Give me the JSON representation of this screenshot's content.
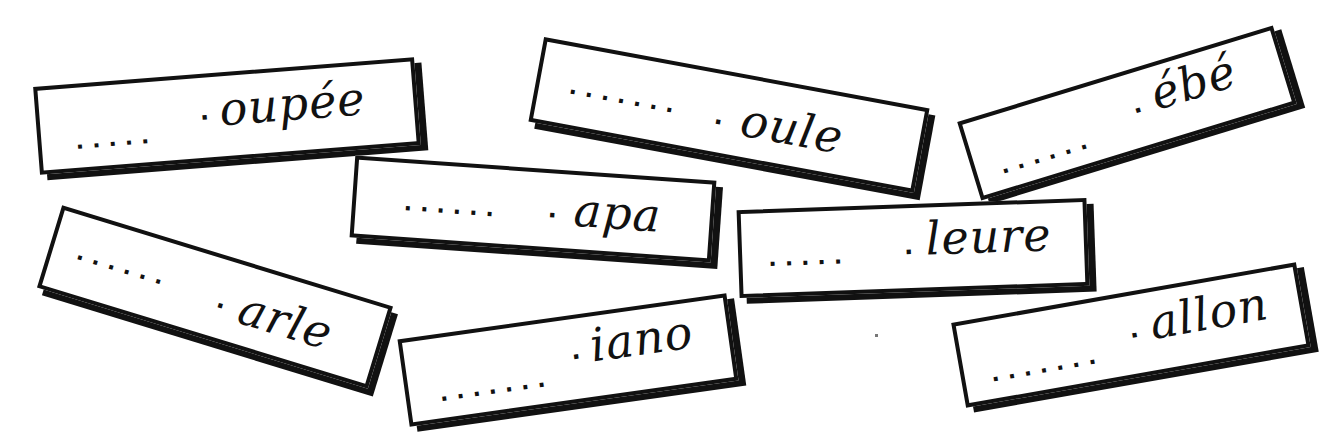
{
  "worksheet": {
    "description": "Word-completion exercise: fill in the missing first letter",
    "placeholder_dots": "......",
    "cards": [
      {
        "id": 1,
        "ending": "oupée",
        "blank": "....."
      },
      {
        "id": 2,
        "ending": "oule",
        "blank": "......."
      },
      {
        "id": 3,
        "ending": "ébé",
        "blank": "......"
      },
      {
        "id": 4,
        "ending": "apa",
        "blank": "......"
      },
      {
        "id": 5,
        "ending": "leure",
        "blank": "....."
      },
      {
        "id": 6,
        "ending": "arle",
        "blank": "......"
      },
      {
        "id": 7,
        "ending": "iano",
        "blank": "......."
      },
      {
        "id": 8,
        "ending": "allon",
        "blank": "......."
      }
    ]
  },
  "colors": {
    "ink": "#111111",
    "paper": "#ffffff"
  }
}
